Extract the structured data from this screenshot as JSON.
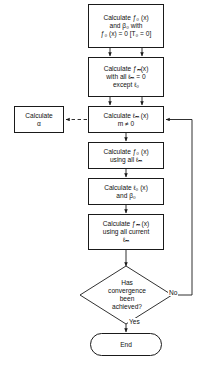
{
  "diagram": {
    "type": "flowchart",
    "colors": {
      "stroke": "#1a1a1a",
      "fill": "#ffffff",
      "text": "#111111"
    },
    "nodes": [
      {
        "id": "box-init",
        "shape": "process",
        "name": "calculate-f0-beta0-box",
        "lines": [
          "Calculate ƒ₀ (x)",
          "and β₀ with",
          "ƒ₀ (x) = 0 [T₀ = 0]"
        ]
      },
      {
        "id": "box-fm-init",
        "shape": "process",
        "name": "calculate-fm-initial-box",
        "lines": [
          "Calculate ƒₘ(x)",
          "with all ℓₘ = 0",
          "except ℓ₀"
        ]
      },
      {
        "id": "box-lm",
        "shape": "process",
        "name": "calculate-lm-box",
        "lines": [
          "Calculate ℓₘ (x)",
          "m ≠ 0"
        ]
      },
      {
        "id": "box-alpha",
        "shape": "process",
        "name": "calculate-alpha-box",
        "lines": [
          "Calculate",
          "α"
        ]
      },
      {
        "id": "box-f0",
        "shape": "process",
        "name": "calculate-f0-using-lm-box",
        "lines": [
          "Calculate ƒ₀ (x)",
          "using all ℓₘ"
        ]
      },
      {
        "id": "box-l0",
        "shape": "process",
        "name": "calculate-l0-beta0-box",
        "lines": [
          "Calculate ℓ₀ (x)",
          "and β₀"
        ]
      },
      {
        "id": "box-fm-cur",
        "shape": "process",
        "name": "calculate-fm-current-box",
        "lines": [
          "Calculate ƒₘ (x)",
          "using all current",
          "ℓₘ"
        ]
      },
      {
        "id": "diamond-convergence",
        "shape": "decision",
        "name": "convergence-decision",
        "lines": [
          "Has",
          "convergence",
          "been",
          "achieved?"
        ]
      },
      {
        "id": "term-end",
        "shape": "terminator",
        "name": "end-terminator",
        "lines": [
          "End"
        ]
      }
    ],
    "edge_labels": {
      "no": "No",
      "yes": "Yes"
    }
  }
}
